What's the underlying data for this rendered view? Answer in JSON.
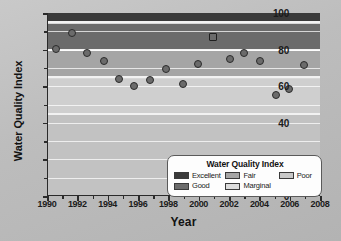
{
  "chart_data": {
    "type": "scatter",
    "title": "",
    "xlabel": "Year",
    "ylabel": "Water Quality Index",
    "xlim": [
      1990,
      2008
    ],
    "ylim": [
      0,
      100
    ],
    "xticks": [
      1990,
      1992,
      1994,
      1996,
      1998,
      2000,
      2002,
      2004,
      2006,
      2008
    ],
    "yticks": [
      0,
      20,
      40,
      60,
      80,
      100
    ],
    "grid": true,
    "legend_position": "bottom-right",
    "series": [
      {
        "name": "Water Quality Index",
        "marker": "circle",
        "points": [
          {
            "x": 1990.5,
            "y": 80.5,
            "filled": true
          },
          {
            "x": 1991.6,
            "y": 89.0,
            "filled": true
          },
          {
            "x": 1992.6,
            "y": 78.0,
            "filled": true
          },
          {
            "x": 1993.7,
            "y": 74.0,
            "filled": true
          },
          {
            "x": 1994.7,
            "y": 64.0,
            "filled": true
          },
          {
            "x": 1995.7,
            "y": 60.0,
            "filled": true
          },
          {
            "x": 1996.7,
            "y": 63.5,
            "filled": true
          },
          {
            "x": 1997.8,
            "y": 69.5,
            "filled": true
          },
          {
            "x": 1998.9,
            "y": 61.0,
            "filled": true
          },
          {
            "x": 1999.9,
            "y": 72.0,
            "filled": true
          },
          {
            "x": 2000.9,
            "y": 87.0,
            "filled": false
          },
          {
            "x": 2002.0,
            "y": 75.0,
            "filled": true
          },
          {
            "x": 2002.9,
            "y": 78.0,
            "filled": true
          },
          {
            "x": 2004.0,
            "y": 73.5,
            "filled": true
          },
          {
            "x": 2005.0,
            "y": 55.0,
            "filled": true
          },
          {
            "x": 2005.9,
            "y": 58.5,
            "filled": true
          },
          {
            "x": 2006.9,
            "y": 71.5,
            "filled": true
          }
        ]
      }
    ],
    "bands": [
      {
        "label": "Excellent",
        "from": 95,
        "to": 100,
        "color": "#3a3a3a"
      },
      {
        "label": "Good",
        "from": 80,
        "to": 94,
        "color": "#6b6b6b"
      },
      {
        "label": "Fair",
        "from": 65,
        "to": 79,
        "color": "#a5a5a5"
      },
      {
        "label": "Marginal",
        "from": 45,
        "to": 64,
        "color": "#cfcfcf"
      },
      {
        "label": "Poor",
        "from": 0,
        "to": 44,
        "color": "#c2c2c2"
      }
    ]
  },
  "axes": {
    "y_title": "Water Quality Index",
    "x_title": "Year",
    "y_tick_labels": [
      "100",
      "80",
      "60",
      "40",
      "20",
      "0"
    ],
    "x_tick_labels": [
      "1990",
      "1992",
      "1994",
      "1996",
      "1998",
      "2000",
      "2002",
      "2004",
      "2006",
      "2008"
    ]
  },
  "legend": {
    "title": "Water Quality Index",
    "column_1": [
      {
        "label": "Excellent",
        "color": "#3a3a3a"
      },
      {
        "label": "Good",
        "color": "#6b6b6b"
      }
    ],
    "column_2": [
      {
        "label": "Fair",
        "color": "#a5a5a5"
      },
      {
        "label": "Marginal",
        "color": "#dcdcdc"
      }
    ],
    "column_3": [
      {
        "label": "Poor",
        "color": "#c8c8c8"
      }
    ]
  }
}
